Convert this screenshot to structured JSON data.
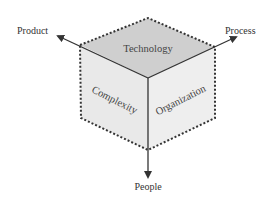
{
  "diagram": {
    "faces": {
      "top": {
        "label": "Technology",
        "color": "#cfcfcf"
      },
      "left": {
        "label": "Complexity",
        "color": "#e8e8e8"
      },
      "right": {
        "label": "Organization",
        "color": "#ececec"
      }
    },
    "axes": {
      "product": "Product",
      "process": "Process",
      "people": "People"
    },
    "line_color": "#333333"
  }
}
